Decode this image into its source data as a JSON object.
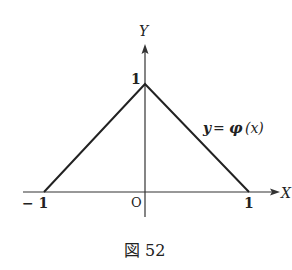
{
  "figure": {
    "caption": "図 52",
    "axes": {
      "x_label": "X",
      "y_label": "Y",
      "origin_label": "O"
    },
    "ticks": {
      "x_neg": "− 1",
      "x_pos": "1",
      "y_top": "1"
    },
    "curve_label": {
      "lhs": "y",
      "eq": "=",
      "fn": "φ",
      "arg": "(x)"
    },
    "function": {
      "name": "φ",
      "points": [
        [
          -1,
          0
        ],
        [
          0,
          1
        ],
        [
          1,
          0
        ]
      ]
    }
  }
}
